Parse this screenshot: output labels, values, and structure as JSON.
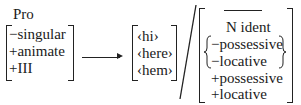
{
  "left_matrix": {
    "head": "Pro",
    "features": [
      "−singular",
      "+animate",
      "+III"
    ]
  },
  "arrow": "→",
  "output_set": [
    "‹hi›",
    "‹here›",
    "‹hem›"
  ],
  "environment_separator": "/",
  "context_matrix": {
    "blank": "",
    "head": "N ident",
    "braced_features": [
      "−possessive",
      "−locative"
    ],
    "features": [
      "+possessive",
      "+locative"
    ]
  }
}
